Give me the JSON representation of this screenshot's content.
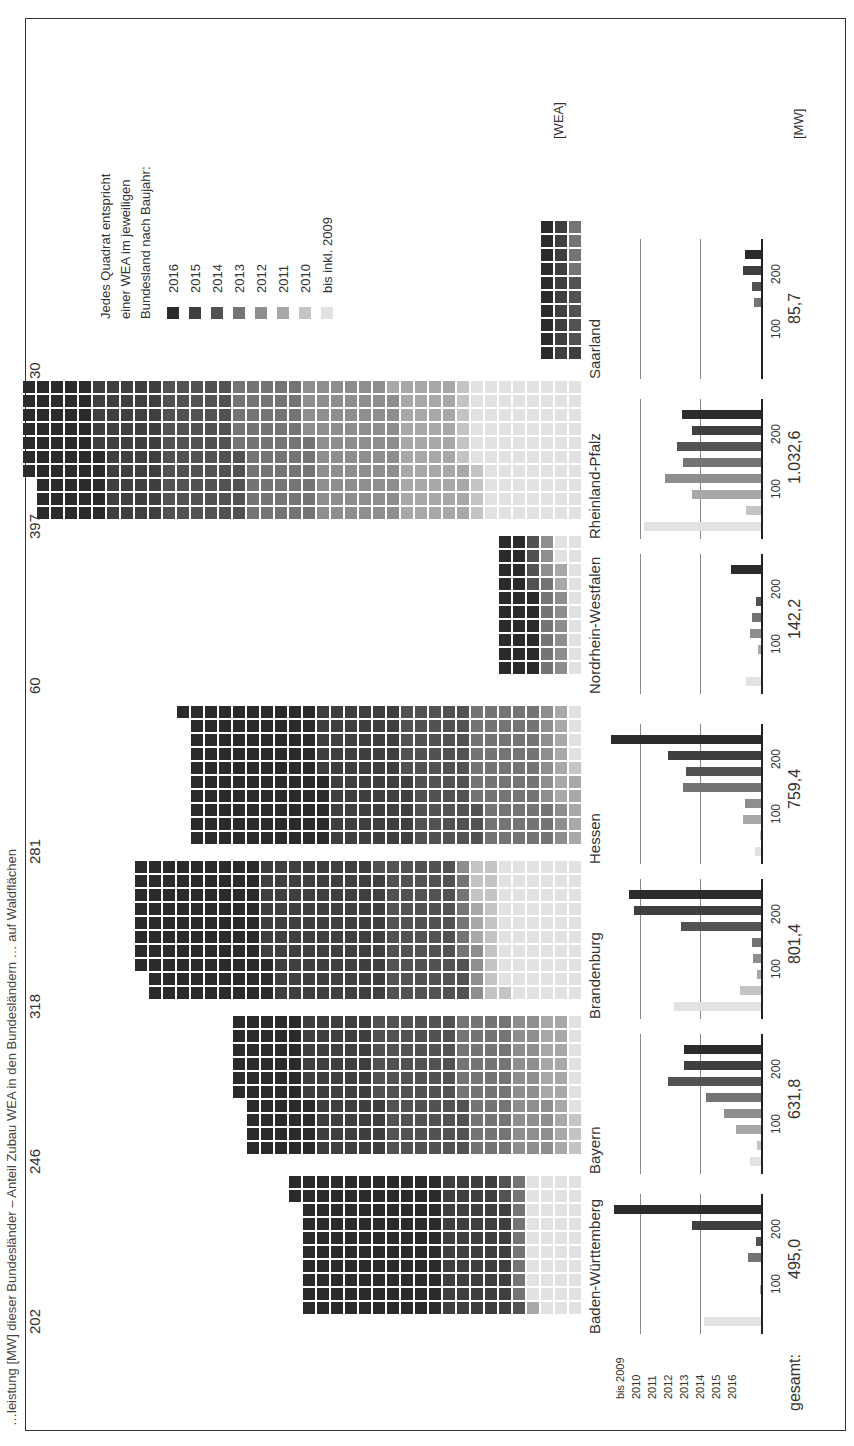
{
  "caption": {
    "text": "…leistung [MW] dieser Bundesländer – Anteil Zubau WEA in den Bundesländern … auf Waldflächen"
  },
  "legend": {
    "title_lines": [
      "Jedes Quadrat entspricht",
      "einer WEA im jeweiligen",
      "Bundesland nach Baujahr:"
    ],
    "items": [
      {
        "label": "2016",
        "color": "#2b2b2b"
      },
      {
        "label": "2015",
        "color": "#3f3f3f"
      },
      {
        "label": "2014",
        "color": "#525252"
      },
      {
        "label": "2013",
        "color": "#747474"
      },
      {
        "label": "2012",
        "color": "#8e8e8e"
      },
      {
        "label": "2011",
        "color": "#a8a8a8"
      },
      {
        "label": "2010",
        "color": "#c4c4c4"
      },
      {
        "label": "bis inkl. 2009",
        "color": "#e2e2e2"
      }
    ]
  },
  "units": {
    "wea": "[WEA]",
    "mw": "[MW]"
  },
  "axis": {
    "years": [
      "bis 2009",
      "2010",
      "2011",
      "2012",
      "2013",
      "2014",
      "2015",
      "2016"
    ],
    "ticks": [
      "100",
      "200"
    ],
    "total_label": "gesamt:"
  },
  "chart_data": [
    {
      "type": "waffle",
      "title": "Anzahl WEA (Windenergieanlagen) je Bundesland nach Baujahr",
      "unit": "WEA",
      "categories": [
        "Baden-Württemberg",
        "Bayern",
        "Brandenburg",
        "Hessen",
        "Nordrhein-Westfalen",
        "Rheinland-Pfalz",
        "Saarland"
      ],
      "values": [
        202,
        246,
        318,
        281,
        60,
        397,
        30
      ]
    },
    {
      "type": "bar",
      "title": "Zugebaute Leistung [MW] je Baujahr",
      "ylabel": "[MW]",
      "ylim": [
        0,
        250
      ],
      "x": [
        "bis 2009",
        "2010",
        "2011",
        "2012",
        "2013",
        "2014",
        "2015",
        "2016"
      ],
      "series": [
        {
          "name": "Baden-Württemberg",
          "total": "495,0",
          "values": [
            95,
            0,
            2,
            0,
            22,
            8,
            115,
            245
          ]
        },
        {
          "name": "Bayern",
          "total": "631,8",
          "values": [
            18,
            7,
            42,
            62,
            92,
            155,
            128,
            128
          ]
        },
        {
          "name": "Brandenburg",
          "total": "801,4",
          "values": [
            145,
            35,
            7,
            13,
            15,
            133,
            212,
            220
          ]
        },
        {
          "name": "Hessen",
          "total": "759,4",
          "values": [
            10,
            2,
            30,
            27,
            130,
            125,
            155,
            250
          ]
        },
        {
          "name": "Nordrhein-Westfalen",
          "total": "142,2",
          "values": [
            25,
            0,
            5,
            19,
            15,
            9,
            0,
            50
          ]
        },
        {
          "name": "Rheinland-Pfalz",
          "total": "1.032,6",
          "values": [
            195,
            25,
            115,
            160,
            130,
            140,
            115,
            132
          ]
        },
        {
          "name": "Saarland",
          "total": "85,7",
          "values": [
            0,
            0,
            0,
            0,
            12,
            15,
            30,
            26
          ]
        }
      ]
    }
  ],
  "states": [
    {
      "name": "Baden-Württemberg",
      "count": "202",
      "total": "495,0"
    },
    {
      "name": "Bayern",
      "count": "246",
      "total": "631,8"
    },
    {
      "name": "Brandenburg",
      "count": "318",
      "total": "801,4"
    },
    {
      "name": "Hessen",
      "count": "281",
      "total": "759,4"
    },
    {
      "name": "Nordrhein-Westfalen",
      "count": "60",
      "total": "142,2"
    },
    {
      "name": "Rheinland-Pfalz",
      "count": "397",
      "total": "1.032,6"
    },
    {
      "name": "Saarland",
      "count": "30",
      "total": "85,7"
    }
  ]
}
